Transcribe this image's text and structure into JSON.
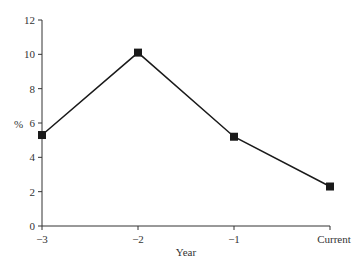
{
  "chart_data": {
    "type": "line",
    "title": "",
    "xlabel": "Year",
    "ylabel": "%",
    "categories": [
      "−3",
      "−2",
      "−1",
      "Current"
    ],
    "values": [
      5.3,
      10.1,
      5.2,
      2.3
    ],
    "series": [
      {
        "name": "%",
        "values": [
          5.3,
          10.1,
          5.2,
          2.3
        ],
        "marker": "square",
        "color": "#1a1a1a"
      }
    ],
    "ylim": [
      0,
      12
    ],
    "yticks": [
      0,
      2,
      4,
      6,
      8,
      10,
      12
    ],
    "ytick_labels": [
      "0",
      "2",
      "4",
      "6",
      "8",
      "10",
      "12"
    ],
    "grid": false,
    "legend": null
  }
}
